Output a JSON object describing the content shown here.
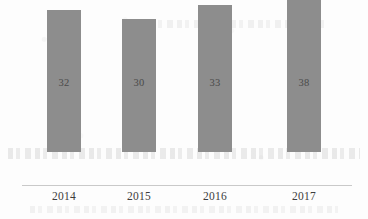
{
  "chart_data": {
    "type": "bar",
    "title": "",
    "subtitle": "",
    "xlabel": "",
    "ylabel": "",
    "categories": [
      "2014",
      "2015",
      "2016",
      "2017"
    ],
    "values": [
      32,
      30,
      33,
      38
    ],
    "value_labels": [
      "32",
      "30",
      "33",
      "38"
    ],
    "ylim": [
      0,
      41
    ],
    "grid": false,
    "legend": false,
    "legend_position": "none",
    "series": [
      {
        "name": "",
        "values": [
          32,
          30,
          33,
          38
        ]
      }
    ],
    "bars": [
      {
        "category": "2014",
        "value": 32,
        "label": "32"
      },
      {
        "category": "2015",
        "value": 30,
        "label": "30"
      },
      {
        "category": "2016",
        "value": 33,
        "label": "33"
      },
      {
        "category": "2017",
        "value": 38,
        "label": "38"
      }
    ]
  },
  "style": {
    "bar_color": "#8d8d8d",
    "axis_color": "#c9c9c9",
    "value_text_color": "#4a4a4a",
    "category_text_color": "#3c3c3c",
    "background_color": "#fdfdfd"
  }
}
